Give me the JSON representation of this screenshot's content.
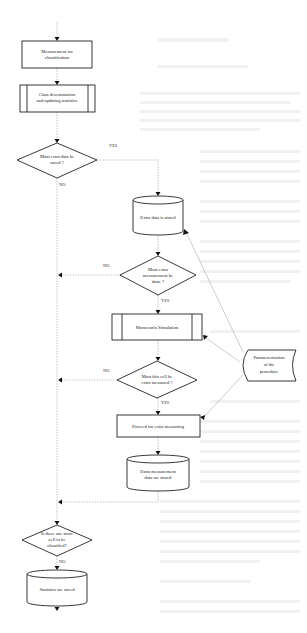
{
  "diagram": {
    "type": "flowchart",
    "nodes": {
      "measurement": {
        "label_lines": [
          "Measurement for",
          "classification"
        ],
        "shape": "process"
      },
      "class_determination": {
        "label_lines": [
          "Class determination",
          "and updating statistics"
        ],
        "shape": "predefined-process"
      },
      "must_save": {
        "label_lines": [
          "Must extra data be",
          "saved ?"
        ],
        "shape": "decision"
      },
      "extra_stored": {
        "label_lines": [
          "Extra data is stored"
        ],
        "shape": "stored-data-cylinder"
      },
      "must_measure": {
        "label_lines": [
          "Must extra",
          "measurement be",
          "done ?"
        ],
        "shape": "decision"
      },
      "montecarlo": {
        "label_lines": [
          "Montecarlo Simulation"
        ],
        "shape": "predefined-process"
      },
      "must_cell": {
        "label_lines": [
          "Must this cell  be",
          "extra measured ?"
        ],
        "shape": "decision"
      },
      "parameterization": {
        "label_lines": [
          "Parameterization",
          "of the",
          "procedure"
        ],
        "shape": "stored-data"
      },
      "proceed": {
        "label_lines": [
          "Proceed for extra measuring"
        ],
        "shape": "process"
      },
      "extra_meas_stored": {
        "label_lines": [
          "Extra measurement",
          "data are stored"
        ],
        "shape": "stored-data-cylinder"
      },
      "more_cells": {
        "label_lines": [
          "Is there one more",
          "cell to be",
          "classified?"
        ],
        "shape": "decision"
      },
      "statistics": {
        "label_lines": [
          "Statistics are saved"
        ],
        "shape": "stored-data-cylinder"
      }
    },
    "edge_labels": {
      "must_save_yes": "YES",
      "must_save_no": "NO",
      "must_measure_no": "NO",
      "must_measure_yes": "YES",
      "must_cell_no": "NO",
      "must_cell_yes": "YES",
      "more_cells_no": "NO"
    },
    "colors": {
      "stroke": "#222222",
      "connector": "#9a9a9a",
      "background": "#ffffff"
    }
  }
}
